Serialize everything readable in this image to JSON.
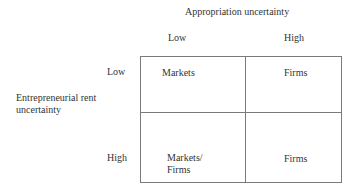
{
  "diagram": {
    "column_axis": {
      "title": "Appropriation uncertainty",
      "levels": [
        "Low",
        "High"
      ]
    },
    "row_axis": {
      "title_line1": "Entrepreneurial rent",
      "title_line2": "uncertainty",
      "levels": [
        "Low",
        "High"
      ]
    },
    "cells": {
      "low_low": "Markets",
      "low_high": "Firms",
      "high_low_line1": "Markets/",
      "high_low_line2": "Firms",
      "high_high": "Firms"
    },
    "colors": {
      "grid_line": "#7a7a7a",
      "text": "#333333",
      "background": "#ffffff"
    }
  }
}
